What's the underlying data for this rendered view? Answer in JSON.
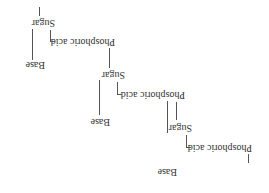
{
  "diagram": {
    "orientation": "rotated 180 degrees",
    "line_color": "#555555",
    "text_color": "#333333",
    "units": [
      {
        "phosphate": "Phosphoric acid",
        "sugar": "Sugar",
        "base": "Base"
      },
      {
        "phosphate": "Phosphoric acid",
        "sugar": "Sugar",
        "base": "Base"
      },
      {
        "phosphate": "Phosphoric acid",
        "sugar": "Sugar",
        "base": "Base"
      }
    ]
  }
}
